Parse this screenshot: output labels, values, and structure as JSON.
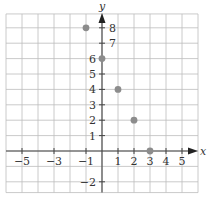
{
  "chart_data": {
    "type": "scatter",
    "title": "",
    "xlabel": "x",
    "ylabel": "y",
    "xlim": [
      -6,
      6
    ],
    "ylim": [
      -2.7,
      8.9
    ],
    "grid": true,
    "grid_step": 1,
    "x_tick_labels": [
      "−5",
      "−3",
      "−1",
      "1",
      "2",
      "3",
      "4",
      "5"
    ],
    "x_tick_values": [
      -5,
      -3,
      -1,
      1,
      2,
      3,
      4,
      5
    ],
    "y_tick_labels": [
      "8",
      "7",
      "6",
      "5",
      "4",
      "3",
      "2",
      "1",
      "−2"
    ],
    "y_tick_values": [
      8,
      7,
      6,
      5,
      4,
      3,
      2,
      1,
      -2
    ],
    "series": [
      {
        "name": "points",
        "points": [
          {
            "x": -1,
            "y": 8
          },
          {
            "x": 0,
            "y": 6
          },
          {
            "x": 1,
            "y": 4
          },
          {
            "x": 2,
            "y": 2
          },
          {
            "x": 3,
            "y": 0
          }
        ],
        "color": "#8c8c8c"
      }
    ]
  }
}
